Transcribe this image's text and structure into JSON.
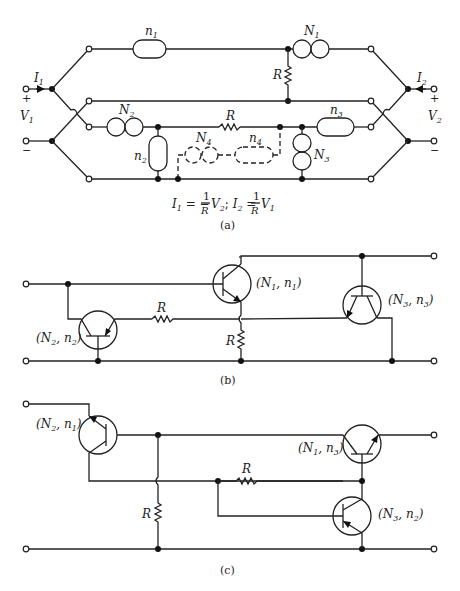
{
  "figure": {
    "panels": [
      {
        "id": "a",
        "caption": "(a)",
        "equation": {
          "left": "I",
          "left_sub": "1",
          "mid1": " = −",
          "frac1_num": "1",
          "frac1_den": "R",
          "v2": "V",
          "v2_sub": "2",
          "sep": ";  ",
          "right": "I",
          "right_sub": "2",
          "mid2": " = ",
          "frac2_num": "1",
          "frac2_den": "R",
          "v1": "V",
          "v1_sub": "1"
        },
        "labels": {
          "I1": "I",
          "I1_sub": "1",
          "I2": "I",
          "I2_sub": "2",
          "V1": "V",
          "V1_sub": "1",
          "V2": "V",
          "V2_sub": "2",
          "plus": "+",
          "minus": "−",
          "n1": "n",
          "n1_sub": "1",
          "N1": "N",
          "N1_sub": "1",
          "R_vertical": "R",
          "R_horizontal": "R",
          "N2": "N",
          "N2_sub": "2",
          "n2": "n",
          "n2_sub": "2",
          "N4": "N",
          "N4_sub": "4",
          "n4": "n",
          "n4_sub": "4",
          "n3": "n",
          "n3_sub": "3",
          "N3": "N",
          "N3_sub": "3"
        }
      },
      {
        "id": "b",
        "caption": "(b)",
        "labels": {
          "t1": "(N",
          "t1_s1": "2",
          "t1_mid": ", n",
          "t1_s2": "2",
          "t1_end": ")",
          "t2": "(N",
          "t2_s1": "1",
          "t2_mid": ", n",
          "t2_s2": "1",
          "t2_end": ")",
          "t3": "(N",
          "t3_s1": "3",
          "t3_mid": ", n",
          "t3_s2": "3",
          "t3_end": ")",
          "R_horizontal": "R",
          "R_vertical": "R"
        }
      },
      {
        "id": "c",
        "caption": "(c)",
        "labels": {
          "t1": "(N",
          "t1_s1": "2",
          "t1_mid": ", n",
          "t1_s2": "1",
          "t1_end": ")",
          "t2": "(N",
          "t2_s1": "1",
          "t2_mid": ", n",
          "t2_s2": "3",
          "t2_end": ")",
          "t3": "(N",
          "t3_s1": "3",
          "t3_mid": ", n",
          "t3_s2": "2",
          "t3_end": ")",
          "R_horizontal": "R",
          "R_vertical": "R"
        }
      }
    ]
  }
}
